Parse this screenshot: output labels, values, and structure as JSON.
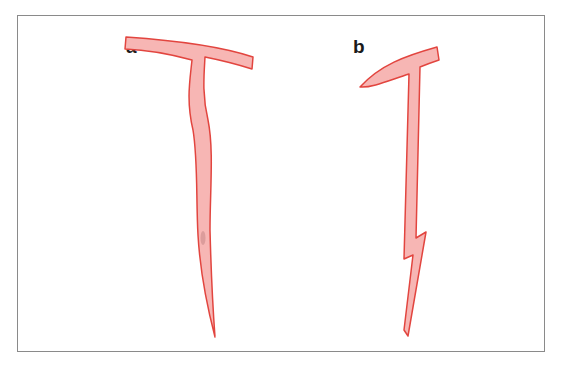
{
  "figure": {
    "panels": [
      {
        "id": "a",
        "label": "a",
        "description": "T-shaped crack branching with long sinuous tapering stem"
      },
      {
        "id": "b",
        "label": "b",
        "description": "Curved branch with straight stem and zig-zag tapering tip"
      }
    ],
    "colors": {
      "fill": "#f7b6b4",
      "stroke": "#e2453f",
      "frame": "#8a8a8a",
      "label": "#1a1a1a"
    }
  }
}
